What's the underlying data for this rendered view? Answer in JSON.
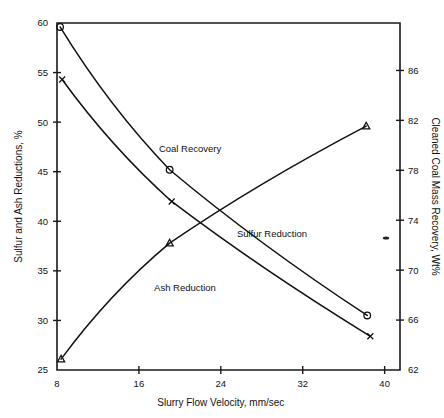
{
  "chart_data": {
    "type": "line",
    "title": "",
    "xlabel": "Slurry Flow Velocity, mm/sec",
    "ylabel": "Sulfur and Ash Reductions, %",
    "y2label": "Cleaned Coal Mass Recovery, Wt%",
    "xlim": [
      8,
      41.5
    ],
    "ylim": [
      25,
      60
    ],
    "y2lim": [
      62,
      89.8
    ],
    "xticks": [
      8,
      16,
      24,
      32,
      40
    ],
    "xticklabels": [
      "8",
      "16",
      "24",
      "32",
      "40"
    ],
    "yticks": [
      25,
      30,
      35,
      40,
      45,
      50,
      55,
      60
    ],
    "yticklabels": [
      "25",
      "30",
      "35",
      "40",
      "45",
      "50",
      "55",
      "60"
    ],
    "y2ticks": [
      62,
      66,
      70,
      74,
      78,
      82,
      86
    ],
    "y2ticklabels": [
      "62",
      "66",
      "70",
      "74",
      "78",
      "82",
      "86"
    ],
    "grid": false,
    "legend_position": "inline-annotations",
    "series": [
      {
        "name": "Sulfur Reduction",
        "axis": "left",
        "marker": "circle",
        "x": [
          8.3,
          19.0,
          38.3
        ],
        "values": [
          59.6,
          45.2,
          30.5
        ]
      },
      {
        "name": "Ash Reduction",
        "axis": "left",
        "marker": "x",
        "x": [
          8.5,
          19.2,
          38.6
        ],
        "values": [
          54.3,
          42.0,
          28.4
        ]
      },
      {
        "name": "Coal Recovery",
        "axis": "right",
        "marker": "triangle",
        "x": [
          8.4,
          19.0,
          38.2
        ],
        "values": [
          26.1,
          37.8,
          49.6
        ]
      }
    ],
    "annotations": [
      {
        "text": "Coal Recovery",
        "x": 21.0,
        "y": 47.0
      },
      {
        "text": "Sulfur Reduction",
        "x": 29.0,
        "y": 38.4
      },
      {
        "text": "Ash Reduction",
        "x": 20.5,
        "y": 33.0
      }
    ]
  }
}
